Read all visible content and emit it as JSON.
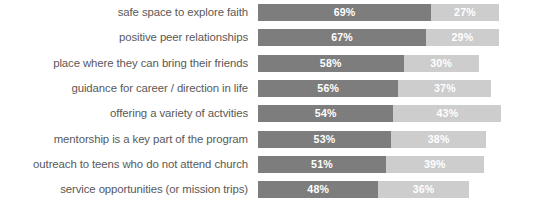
{
  "chart_data": {
    "type": "bar",
    "subtype": "horizontal-stacked-bar",
    "title": "",
    "subtitle": "",
    "xlabel": "",
    "ylabel": "",
    "grid": false,
    "legend": "none",
    "axis_visible": false,
    "value_suffix": "%",
    "xlim": [
      0,
      100
    ],
    "orientation": "horizontal",
    "stacked": true,
    "categories": [
      "safe space to explore faith",
      "positive peer relationships",
      "place where they can bring their friends",
      "guidance for career / direction in life",
      "offering a variety of actvities",
      "mentorship is a key part of the program",
      "outreach to teens who do not attend church",
      "service opportunities (or mission trips)"
    ],
    "series": [
      {
        "name": "primary",
        "color": "#7d7d7d",
        "values": [
          69,
          67,
          58,
          56,
          54,
          53,
          51,
          48
        ],
        "labels": [
          "69%",
          "67%",
          "58%",
          "56%",
          "54%",
          "53%",
          "51%",
          "48%"
        ]
      },
      {
        "name": "secondary",
        "color": "#cdcdcd",
        "values": [
          27,
          29,
          30,
          37,
          43,
          38,
          39,
          36
        ],
        "labels": [
          "27%",
          "29%",
          "30%",
          "37%",
          "43%",
          "38%",
          "39%",
          "36%"
        ]
      }
    ],
    "colors": {
      "primary": "#7d7d7d",
      "secondary": "#cdcdcd",
      "label_text": "#595959",
      "value_text": "#ffffff",
      "background": "#ffffff"
    }
  }
}
